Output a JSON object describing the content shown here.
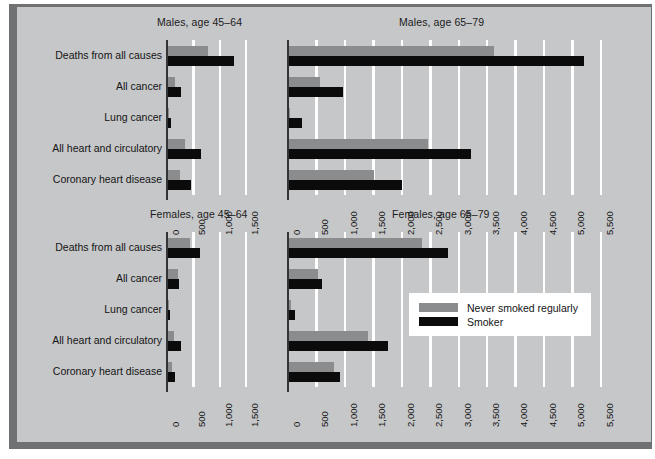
{
  "chart_data": {
    "type": "bar",
    "title": "",
    "orientation": "horizontal",
    "grid": true,
    "legend_position": "center-right (over Females, age 65-79 panel)",
    "legend": [
      {
        "name": "Never smoked regularly",
        "color": "#8a8c8e"
      },
      {
        "name": "Smoker",
        "color": "#0b0b0c"
      }
    ],
    "categories": [
      "Deaths from all causes",
      "All cancer",
      "Lung cancer",
      "All heart and circulatory",
      "Coronary heart disease"
    ],
    "panels": [
      {
        "id": "males-45-64",
        "title": "Males, age 45–64",
        "xlabel": "",
        "ylabel": "",
        "xlim": [
          0,
          1750
        ],
        "xticks": [
          0,
          500,
          1000,
          1500
        ],
        "xticklabels": [
          "0",
          "500",
          "1,000",
          "1,500"
        ],
        "series": [
          {
            "name": "Never smoked regularly",
            "values": [
              760,
              140,
              25,
              330,
              240
            ]
          },
          {
            "name": "Smoker",
            "values": [
              1270,
              260,
              70,
              640,
              440
            ]
          }
        ]
      },
      {
        "id": "males-65-79",
        "title": "Males, age 65–79",
        "xlabel": "",
        "ylabel": "",
        "xlim": [
          0,
          5750
        ],
        "xticks": [
          0,
          500,
          1000,
          1500,
          2000,
          2500,
          3000,
          3500,
          4000,
          4500,
          5000,
          5500
        ],
        "xticklabels": [
          "0",
          "500",
          "1,000",
          "1,500",
          "2,000",
          "2,500",
          "3,000",
          "3,500",
          "4,000",
          "4,500",
          "5,000",
          "5,500"
        ],
        "series": [
          {
            "name": "Never smoked regularly",
            "values": [
              3620,
              550,
              30,
              2450,
              1500
            ]
          },
          {
            "name": "Smoker",
            "values": [
              5200,
              950,
              240,
              3200,
              2000
            ]
          }
        ]
      },
      {
        "id": "females-45-64",
        "title": "Females, age 45–64",
        "xlabel": "",
        "ylabel": "",
        "xlim": [
          0,
          1750
        ],
        "xticks": [
          0,
          500,
          1000,
          1500
        ],
        "xticklabels": [
          "0",
          "500",
          "1,000",
          "1,500"
        ],
        "series": [
          {
            "name": "Never smoked regularly",
            "values": [
              420,
              190,
              10,
              125,
              90
            ]
          },
          {
            "name": "Smoker",
            "values": [
              620,
              210,
              45,
              250,
              135
            ]
          }
        ]
      },
      {
        "id": "females-65-79",
        "title": "Females, age 65–79",
        "xlabel": "",
        "ylabel": "",
        "xlim": [
          0,
          5750
        ],
        "xticks": [
          0,
          500,
          1000,
          1500,
          2000,
          2500,
          3000,
          3500,
          4000,
          4500,
          5000,
          5500
        ],
        "xticklabels": [
          "0",
          "500",
          "1,000",
          "1,500",
          "2,000",
          "2,500",
          "3,000",
          "3,500",
          "4,000",
          "4,500",
          "5,000",
          "5,500"
        ],
        "series": [
          {
            "name": "Never smoked regularly",
            "values": [
              2350,
              520,
              40,
              1400,
              790
            ]
          },
          {
            "name": "Smoker",
            "values": [
              2800,
              590,
              110,
              1750,
              900
            ]
          }
        ]
      }
    ],
    "colors": {
      "never_smoked": "#8a8c8e",
      "smoker": "#0b0b0c",
      "panel_background": "#c6c7c9",
      "gridline": "#ffffff",
      "axis": "#333436",
      "frame_shadow": "#6f7173"
    }
  }
}
